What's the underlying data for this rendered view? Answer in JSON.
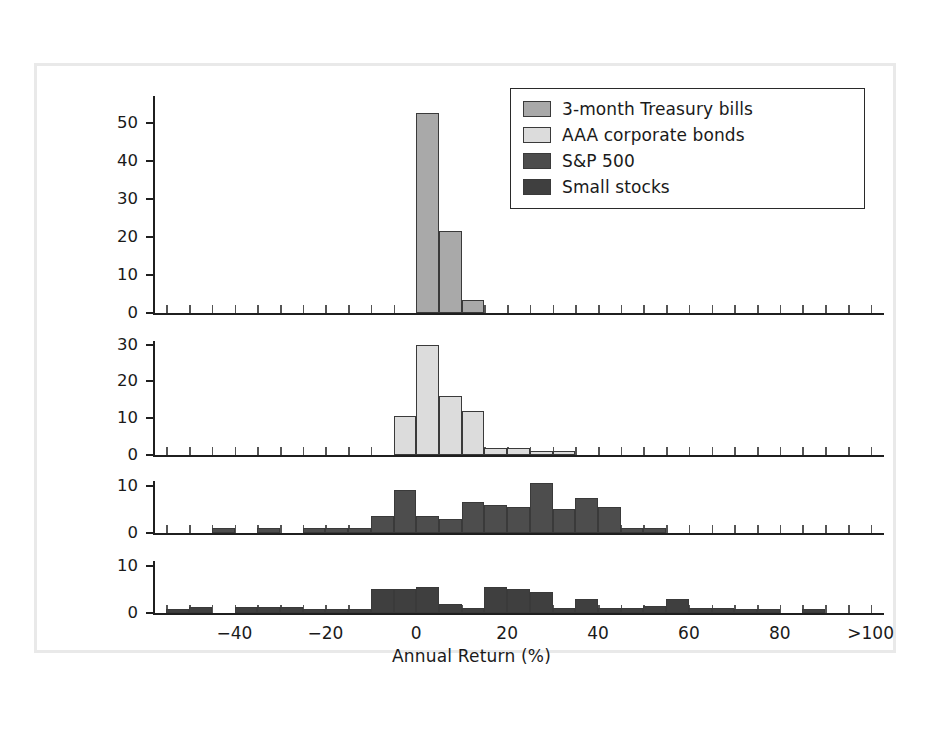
{
  "chart_data": {
    "type": "bar",
    "title": "",
    "subtitle": "",
    "xlabel": "Annual Return (%)",
    "ylabel": "Frequency (number of years)",
    "grid": false,
    "legend_position": "top-right",
    "xlim": [
      -57.5,
      102.5
    ],
    "bin_width": 5,
    "xticks": [
      -40,
      -20,
      0,
      20,
      40,
      60,
      80,
      100
    ],
    "xticklabels": [
      "−40",
      "−20",
      "0",
      "20",
      "40",
      "60",
      "80",
      ">100"
    ],
    "panels": [
      {
        "name": "3-month Treasury bills",
        "color": "#a9a9a9",
        "ylim": [
          0,
          57
        ],
        "yticks": [
          0,
          10,
          20,
          30,
          40,
          50
        ],
        "yticklabels": [
          "0",
          "10",
          "20",
          "30",
          "40",
          "50"
        ],
        "bins": [
          0,
          5,
          10
        ],
        "values": [
          52.5,
          21.5,
          3.5
        ]
      },
      {
        "name": "AAA corporate bonds",
        "color": "#dcdcdc",
        "ylim": [
          0,
          31
        ],
        "yticks": [
          0,
          10,
          20,
          30
        ],
        "yticklabels": [
          "0",
          "10",
          "20",
          "30"
        ],
        "bins": [
          -5,
          0,
          5,
          10,
          15,
          20,
          25,
          30
        ],
        "values": [
          10.5,
          30,
          16,
          12,
          2,
          2,
          1,
          1
        ]
      },
      {
        "name": "S&P 500",
        "color": "#4d4d4d",
        "ylim": [
          0,
          11
        ],
        "yticks": [
          0,
          10
        ],
        "yticklabels": [
          "0",
          "10"
        ],
        "bins": [
          -45,
          -35,
          -25,
          -20,
          -15,
          -10,
          -5,
          0,
          5,
          10,
          15,
          20,
          25,
          30,
          35,
          40,
          45,
          50
        ],
        "values": [
          1,
          1,
          1,
          1,
          1,
          3.5,
          9,
          3.5,
          3,
          6.5,
          6,
          5.5,
          10.5,
          5,
          7.5,
          5.5,
          1,
          1,
          1.5
        ]
      },
      {
        "name": "Small stocks",
        "color": "#3f3f3f",
        "ylim": [
          0,
          11
        ],
        "yticks": [
          0,
          10
        ],
        "yticklabels": [
          "0",
          "10"
        ],
        "bins": [
          -55,
          -50,
          -40,
          -35,
          -30,
          -25,
          -20,
          -15,
          -10,
          -5,
          0,
          5,
          10,
          15,
          20,
          25,
          30,
          35,
          40,
          45,
          50,
          55,
          60,
          65,
          70,
          75,
          85,
          90,
          95
        ],
        "values": [
          0.8,
          1.2,
          1.2,
          1.2,
          1.2,
          0.8,
          0.8,
          0.8,
          5,
          5,
          5.5,
          2,
          1,
          5.5,
          5,
          4.5,
          1,
          3,
          1,
          1,
          1.5,
          3,
          1,
          1,
          0.8,
          0.8,
          0.8
        ]
      }
    ],
    "legend": [
      {
        "label": "3-month Treasury bills",
        "color": "#a9a9a9"
      },
      {
        "label": "AAA corporate bonds",
        "color": "#dcdcdc"
      },
      {
        "label": "S&P 500",
        "color": "#4d4d4d"
      },
      {
        "label": "Small stocks",
        "color": "#3f3f3f"
      }
    ]
  }
}
